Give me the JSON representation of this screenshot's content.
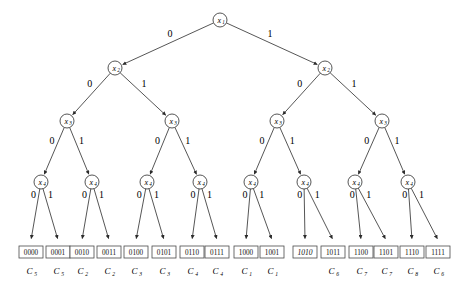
{
  "figure": {
    "kind": "binary-decision-tree",
    "root_label": "x",
    "root_sub": "1"
  },
  "levels": [
    {
      "depth": 1,
      "variable": "x",
      "subscript": "1",
      "count": 1
    },
    {
      "depth": 2,
      "variable": "x",
      "subscript": "2",
      "count": 2
    },
    {
      "depth": 3,
      "variable": "x",
      "subscript": "3",
      "count": 4
    },
    {
      "depth": 4,
      "variable": "x",
      "subscript": "4",
      "count": 8
    }
  ],
  "edge_labels": {
    "left": "0",
    "right": "1"
  },
  "nodes": {
    "level1": [
      {
        "id": "n1",
        "x": 220,
        "y": 20,
        "label": "x",
        "sub": "1"
      }
    ],
    "level2": [
      {
        "id": "n2a",
        "x": 115,
        "y": 68,
        "label": "x",
        "sub": "2"
      },
      {
        "id": "n2b",
        "x": 325,
        "y": 68,
        "label": "x",
        "sub": "2"
      }
    ],
    "level3": [
      {
        "id": "n3a",
        "x": 67,
        "y": 121,
        "label": "x",
        "sub": "3"
      },
      {
        "id": "n3b",
        "x": 172,
        "y": 121,
        "label": "x",
        "sub": "3"
      },
      {
        "id": "n3c",
        "x": 277,
        "y": 121,
        "label": "x",
        "sub": "3"
      },
      {
        "id": "n3d",
        "x": 382,
        "y": 121,
        "label": "x",
        "sub": "3"
      }
    ],
    "level4": [
      {
        "id": "n4a",
        "x": 41,
        "y": 182,
        "label": "x",
        "sub": "4"
      },
      {
        "id": "n4b",
        "x": 92,
        "y": 182,
        "label": "x",
        "sub": "4"
      },
      {
        "id": "n4c",
        "x": 147,
        "y": 182,
        "label": "x",
        "sub": "4"
      },
      {
        "id": "n4d",
        "x": 200,
        "y": 182,
        "label": "x",
        "sub": "4"
      },
      {
        "id": "n4e",
        "x": 251,
        "y": 182,
        "label": "x",
        "sub": "4"
      },
      {
        "id": "n4f",
        "x": 304,
        "y": 182,
        "label": "x",
        "sub": "4"
      },
      {
        "id": "n4g",
        "x": 355,
        "y": 182,
        "label": "x",
        "sub": "4"
      },
      {
        "id": "n4h",
        "x": 408,
        "y": 182,
        "label": "x",
        "sub": "4"
      }
    ]
  },
  "leaves": [
    {
      "code": "0000",
      "x": 31,
      "italic": false,
      "class_label": "C",
      "class_sub": "5"
    },
    {
      "code": "0001",
      "x": 58,
      "italic": false,
      "class_label": "C",
      "class_sub": "5"
    },
    {
      "code": "0010",
      "x": 82,
      "italic": false,
      "class_label": "C",
      "class_sub": "2"
    },
    {
      "code": "0011",
      "x": 109,
      "italic": false,
      "class_label": "C",
      "class_sub": "2"
    },
    {
      "code": "0100",
      "x": 136,
      "italic": false,
      "class_label": "C",
      "class_sub": "3"
    },
    {
      "code": "0101",
      "x": 164,
      "italic": false,
      "class_label": "C",
      "class_sub": "3"
    },
    {
      "code": "0110",
      "x": 192,
      "italic": false,
      "class_label": "C",
      "class_sub": "4"
    },
    {
      "code": "0111",
      "x": 217,
      "italic": false,
      "class_label": "C",
      "class_sub": "4"
    },
    {
      "code": "1000",
      "x": 246,
      "italic": false,
      "class_label": "C",
      "class_sub": "1"
    },
    {
      "code": "1001",
      "x": 272,
      "italic": false,
      "class_label": "C",
      "class_sub": "1"
    },
    {
      "code": "1010",
      "x": 305,
      "italic": true,
      "class_label": "",
      "class_sub": ""
    },
    {
      "code": "1011",
      "x": 333,
      "italic": false,
      "class_label": "C",
      "class_sub": "6"
    },
    {
      "code": "1100",
      "x": 361,
      "italic": false,
      "class_label": "C",
      "class_sub": "7"
    },
    {
      "code": "1101",
      "x": 386,
      "italic": false,
      "class_label": "C",
      "class_sub": "7"
    },
    {
      "code": "1110",
      "x": 412,
      "italic": false,
      "class_label": "C",
      "class_sub": "8"
    },
    {
      "code": "1111",
      "x": 438,
      "italic": false,
      "class_label": "C",
      "class_sub": "6"
    }
  ],
  "geometry": {
    "leaf_box_y": 246,
    "leaf_box_h": 12,
    "leaf_box_w": 24,
    "class_row_y": 274,
    "node_radius": 7
  }
}
